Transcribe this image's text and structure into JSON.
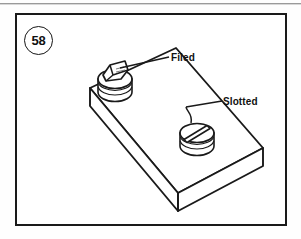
{
  "figure": {
    "number": "58",
    "caption_labels": {
      "filed": "Filed",
      "slotted": "Slotted"
    }
  },
  "illustration": {
    "type": "technical-line-drawing",
    "subject": "rectangular metal block in isometric projection with two circular plugs inset in its top face",
    "parts": [
      {
        "name": "filed-plug",
        "label": "Filed",
        "description": "cylindrical plug with an angled filed flat on the top face",
        "position": {
          "x": 100,
          "y": 84
        }
      },
      {
        "name": "slotted-plug",
        "label": "Slotted",
        "description": "cylindrical plug with a straight screwdriver slot cut across the head",
        "position": {
          "x": 182,
          "y": 137
        }
      }
    ],
    "colors": {
      "line": "#1a1a1a",
      "fill": "#ffffff",
      "paper": "#ffffff",
      "shading": "#e9e9e9"
    }
  }
}
